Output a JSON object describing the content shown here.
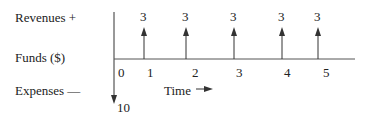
{
  "diagram": {
    "type": "cash-flow-diagram",
    "row_labels": {
      "revenues": "Revenues +",
      "funds": "Funds ($)",
      "expenses": "Expenses —"
    },
    "time_axis_label": "Time",
    "time_ticks": [
      "0",
      "1",
      "2",
      "3",
      "4",
      "5"
    ],
    "cash_flows": [
      {
        "period": "0",
        "direction": "down",
        "amount": "10"
      },
      {
        "period": "1",
        "direction": "up",
        "amount": "3"
      },
      {
        "period": "2",
        "direction": "up",
        "amount": "3"
      },
      {
        "period": "3",
        "direction": "up",
        "amount": "3"
      },
      {
        "period": "4",
        "direction": "up",
        "amount": "3"
      },
      {
        "period": "5",
        "direction": "up",
        "amount": "3"
      }
    ],
    "colors": {
      "line": "#333333",
      "text": "#222222",
      "background": "#ffffff"
    }
  }
}
